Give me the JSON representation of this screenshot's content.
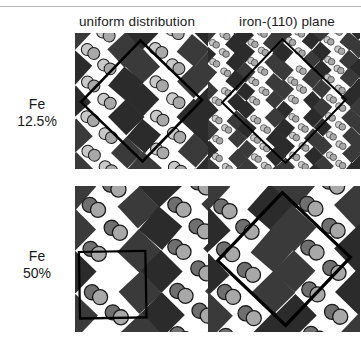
{
  "figure": {
    "title": "",
    "columns": [
      {
        "id": "uniform",
        "label": "uniform distribution"
      },
      {
        "id": "iron110",
        "label": "iron-(110) plane"
      }
    ],
    "rows": [
      {
        "id": "fe125",
        "line1": "Fe",
        "line2": "12.5%"
      },
      {
        "id": "fe50",
        "line1": "Fe",
        "line2": "50%"
      }
    ]
  },
  "colors": {
    "background": "#ffffff",
    "octahedron_dark": "#2b2b2b",
    "octahedron_mid": "#3a3a3a",
    "atom_light": "#c9c9c9",
    "atom_mid": "#a8a8a8",
    "atom_dark": "#6f6f6f",
    "atom_outline": "#1a1a1a",
    "unitcell_line": "#000000",
    "rule": "#b9b9b9",
    "text": "#1a1a1a"
  },
  "chart_data": {
    "type": "diagram",
    "grid": {
      "rows": 2,
      "cols": 2
    },
    "row_variable": "Fe concentration",
    "col_variable": "Fe arrangement",
    "categories_rows": [
      "Fe 12.5%",
      "Fe 50%"
    ],
    "categories_cols": [
      "uniform distribution",
      "iron-(110) plane"
    ],
    "panels": [
      {
        "row": "Fe 12.5%",
        "col": "uniform distribution",
        "lattice_pitch_px": 34,
        "square_size_px": 24,
        "rotation_deg": 45,
        "unit_cell_shape": "diamond",
        "unit_cell_note": "large rotated square spanning most of the panel",
        "atom_pairs_per_site": 2,
        "atom_shades": [
          "light",
          "mid"
        ]
      },
      {
        "row": "Fe 12.5%",
        "col": "iron-(110) plane",
        "lattice_pitch_px": 19,
        "square_size_px": 14,
        "rotation_deg": 45,
        "unit_cell_shape": "diamond",
        "unit_cell_note": "large thick diamond, apex near top-left of panel",
        "atom_pairs_per_site": 2,
        "atom_shades": [
          "light",
          "mid"
        ]
      },
      {
        "row": "Fe 50%",
        "col": "uniform distribution",
        "lattice_pitch_px": 43,
        "square_size_px": 32,
        "rotation_deg": 45,
        "unit_cell_shape": "square",
        "unit_cell_note": "upright square outline in lower-left quadrant",
        "atom_pairs_per_site": 2,
        "atom_shades": [
          "dark",
          "mid"
        ]
      },
      {
        "row": "Fe 50%",
        "col": "iron-(110) plane",
        "lattice_pitch_px": 43,
        "square_size_px": 32,
        "rotation_deg": 45,
        "unit_cell_shape": "diamond",
        "unit_cell_note": "large rotated square centred in the panel",
        "atom_pairs_per_site": 2,
        "atom_shades": [
          "dark",
          "mid"
        ]
      }
    ],
    "legend": [],
    "axis_labels": {
      "x": "",
      "y": ""
    }
  }
}
